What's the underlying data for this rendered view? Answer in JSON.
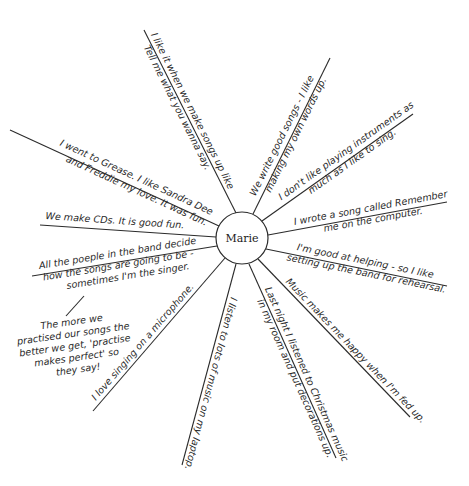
{
  "diagram": {
    "type": "spider-diagram",
    "center": {
      "label": "Marie",
      "x": 242,
      "y": 238,
      "r": 26
    },
    "spokes": [
      {
        "id": "s1",
        "end": [
          144,
          30
        ],
        "lines": [
          "I like it when we make songs up like",
          "Tell me what you wanna say."
        ]
      },
      {
        "id": "s2",
        "end": [
          330,
          58
        ],
        "lines": [
          "We write good songs - I like",
          "making my own words up."
        ]
      },
      {
        "id": "s3",
        "end": [
          413,
          114
        ],
        "lines": [
          "I don't like playing instruments as",
          "much as I like to sing."
        ]
      },
      {
        "id": "s4",
        "end": [
          447,
          202
        ],
        "lines": [
          "I wrote a song called Remember",
          "me on the computer."
        ]
      },
      {
        "id": "s5",
        "end": [
          447,
          286
        ],
        "lines": [
          "I'm good at helping - so I like",
          "setting up the band for rehearsal."
        ]
      },
      {
        "id": "s6",
        "end": [
          410,
          417
        ],
        "lines": [
          "Music makes me happy when I'm fed up.",
          ""
        ]
      },
      {
        "id": "s7",
        "end": [
          336,
          458
        ],
        "lines": [
          "Last night I listened to Christmas music",
          "in my room and put decorations up."
        ]
      },
      {
        "id": "s8",
        "end": [
          182,
          465
        ],
        "lines": [
          "I listen to lots of music on my laptop.",
          ""
        ]
      },
      {
        "id": "s9",
        "end": [
          93,
          411
        ],
        "lines": [
          "I love singing on a microphone.",
          ""
        ]
      },
      {
        "id": "s10",
        "end": [
          32,
          276
        ],
        "lines": [
          "All the poeple in the band decide",
          "how the songs are going to be -",
          "sometimes I'm the singer."
        ]
      },
      {
        "id": "s11",
        "end": [
          40,
          225
        ],
        "lines": [
          "We make CDs. It is good fun.",
          ""
        ]
      },
      {
        "id": "s12",
        "end": [
          10,
          130
        ],
        "lines": [
          "I went to Grease. I like Sandra Dee",
          "and Freddie my love. It was fun."
        ]
      }
    ],
    "branch_note": {
      "lines": [
        "The more we",
        "practised our songs the",
        "better we get, 'practise",
        "makes perfect' so",
        "they say!"
      ]
    }
  }
}
